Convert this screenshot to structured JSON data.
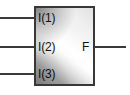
{
  "diagram": {
    "block": {
      "name": "logic-block",
      "fill_style": "diagonal-gradient",
      "border_color": "#383838",
      "fill_light": "#ffffff",
      "fill_dark": "#8e8e8e"
    },
    "inputs": [
      {
        "label": "I(1)",
        "wire": "input-wire-1"
      },
      {
        "label": "I(2)",
        "wire": "input-wire-2"
      },
      {
        "label": "I(3)",
        "wire": "input-wire-3"
      }
    ],
    "outputs": [
      {
        "label": "F",
        "wire": "output-wire-f"
      }
    ]
  }
}
